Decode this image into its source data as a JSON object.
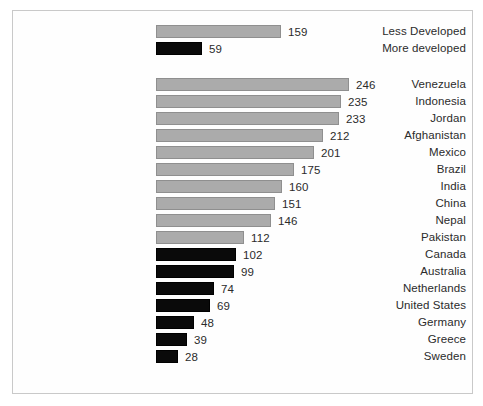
{
  "chart_data": {
    "type": "bar",
    "orientation": "horizontal",
    "title": "",
    "subtitle": "",
    "xlabel": "",
    "ylabel": "",
    "grid": false,
    "legend": null,
    "axis_visible": false,
    "value_labels": true,
    "xlim": [
      0,
      246
    ],
    "colors": {
      "gray": "#ababab",
      "black": "#0a0a0a",
      "frame": "#c9c9c9",
      "text": "#2b2b2b",
      "background": "#ffffff"
    },
    "groups": [
      {
        "name": "summary",
        "categories": [
          "Less Developed",
          "More developed"
        ],
        "values": [
          159,
          59
        ],
        "series_color": [
          "gray",
          "black"
        ]
      },
      {
        "name": "countries",
        "categories": [
          "Venezuela",
          "Indonesia",
          "Jordan",
          "Afghanistan",
          "Mexico",
          "Brazil",
          "India",
          "China",
          "Nepal",
          "Pakistan",
          "Canada",
          "Australia",
          "Netherlands",
          "United States",
          "Germany",
          "Greece",
          "Sweden"
        ],
        "values": [
          246,
          235,
          233,
          212,
          201,
          175,
          160,
          151,
          146,
          112,
          102,
          99,
          74,
          69,
          48,
          39,
          28
        ],
        "series_color": [
          "gray",
          "gray",
          "gray",
          "gray",
          "gray",
          "gray",
          "gray",
          "gray",
          "gray",
          "gray",
          "black",
          "black",
          "black",
          "black",
          "black",
          "black",
          "black"
        ]
      }
    ]
  }
}
